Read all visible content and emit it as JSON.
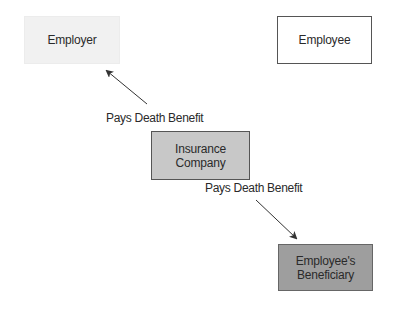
{
  "diagram": {
    "title": "",
    "nodes": [
      {
        "id": "employer",
        "lines": [
          "Employer"
        ],
        "fill": "#f1f1f1",
        "border": "#ececec"
      },
      {
        "id": "employee",
        "lines": [
          "Employee"
        ],
        "fill": "#ffffff",
        "border": "#555555"
      },
      {
        "id": "insurance",
        "lines": [
          "Insurance",
          "Company"
        ],
        "fill": "#c8c8c8",
        "border": "#555555"
      },
      {
        "id": "beneficiary",
        "lines": [
          "Employee's",
          "Beneficiary"
        ],
        "fill": "#9e9e9e",
        "border": "#666666"
      }
    ],
    "edges": [
      {
        "from": "insurance",
        "to": "employer",
        "label": "Pays Death Benefit"
      },
      {
        "from": "insurance",
        "to": "beneficiary",
        "label": "Pays Death Benefit"
      }
    ]
  },
  "colors": {
    "arrow": "#333333",
    "text": "#2a2a2a",
    "background": "#ffffff"
  }
}
